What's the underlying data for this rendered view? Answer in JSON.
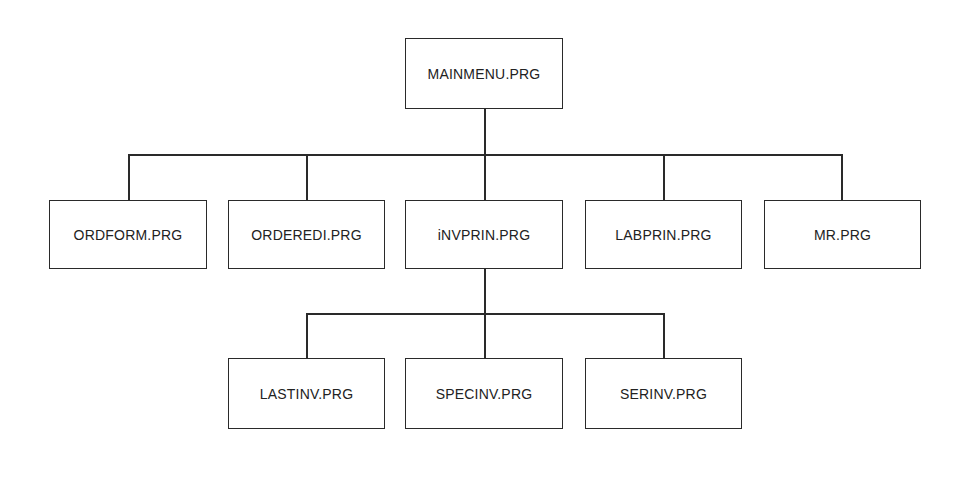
{
  "diagram": {
    "type": "hierarchy-chart",
    "root": {
      "label": "MAINMENU.PRG"
    },
    "level1": [
      {
        "label": "ORDFORM.PRG"
      },
      {
        "label": "ORDEREDI.PRG"
      },
      {
        "label": "iNVPRIN.PRG"
      },
      {
        "label": "LABPRIN.PRG"
      },
      {
        "label": "MR.PRG"
      }
    ],
    "level2": [
      {
        "label": "LASTINV.PRG",
        "parent": "iNVPRIN.PRG"
      },
      {
        "label": "SPECINV.PRG",
        "parent": "iNVPRIN.PRG"
      },
      {
        "label": "SERINV.PRG",
        "parent": "iNVPRIN.PRG"
      }
    ]
  }
}
